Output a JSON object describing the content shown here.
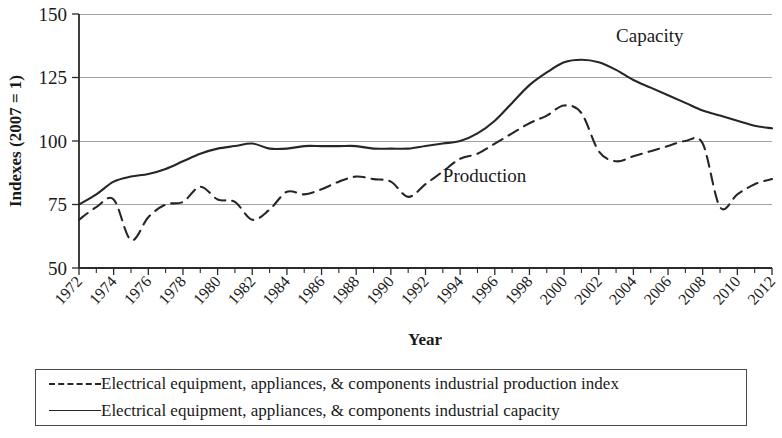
{
  "chart_data": {
    "type": "line",
    "title": "",
    "xlabel": "Year",
    "ylabel": "Indexes (2007 = 1)",
    "xlim": [
      1972,
      2012
    ],
    "ylim": [
      50,
      150
    ],
    "yticks": [
      50,
      75,
      100,
      125,
      150
    ],
    "xticks": [
      1972,
      1974,
      1976,
      1978,
      1980,
      1982,
      1984,
      1986,
      1988,
      1990,
      1992,
      1994,
      1996,
      1998,
      2000,
      2002,
      2004,
      2006,
      2008,
      2010,
      2012
    ],
    "grid": "horizontal",
    "legend_position": "below",
    "x": [
      1972,
      1973,
      1974,
      1975,
      1976,
      1977,
      1978,
      1979,
      1980,
      1981,
      1982,
      1983,
      1984,
      1985,
      1986,
      1987,
      1988,
      1989,
      1990,
      1991,
      1992,
      1993,
      1994,
      1995,
      1996,
      1997,
      1998,
      1999,
      2000,
      2001,
      2002,
      2003,
      2004,
      2005,
      2006,
      2007,
      2008,
      2009,
      2010,
      2011,
      2012
    ],
    "series": [
      {
        "name": "Electrical equipment, appliances, & components industrial production index",
        "key": "production",
        "style": "dashed",
        "annotation": "Production",
        "values": [
          69,
          74,
          77,
          61,
          70,
          75,
          76,
          82,
          77,
          76,
          69,
          73,
          80,
          79,
          81,
          84,
          86,
          85,
          84,
          78,
          83,
          88,
          93,
          95,
          99,
          103,
          107,
          110,
          114,
          111,
          96,
          92,
          94,
          96,
          98,
          100,
          99,
          74,
          79,
          83,
          85
        ]
      },
      {
        "name": "Electrical equipment, appliances, & components industrial capacity",
        "key": "capacity",
        "style": "solid",
        "annotation": "Capacity",
        "values": [
          75,
          79,
          84,
          86,
          87,
          89,
          92,
          95,
          97,
          98,
          99,
          97,
          97,
          98,
          98,
          98,
          98,
          97,
          97,
          97,
          98,
          99,
          100,
          103,
          108,
          115,
          122,
          127,
          131,
          132,
          131,
          128,
          124,
          121,
          118,
          115,
          112,
          110,
          108,
          106,
          105
        ]
      }
    ],
    "annotations": [
      {
        "text": "Capacity",
        "x": 2003,
        "y": 139
      },
      {
        "text": "Production",
        "x": 1993,
        "y": 84
      }
    ]
  },
  "legend": {
    "entries": [
      {
        "marker": "dashed-line",
        "label": "Electrical equipment, appliances, & components industrial production index"
      },
      {
        "marker": "solid-line",
        "label": "Electrical equipment, appliances, & components industrial capacity"
      }
    ]
  }
}
